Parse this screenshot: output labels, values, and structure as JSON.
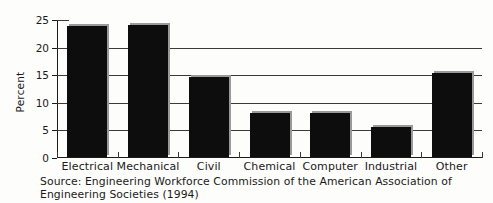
{
  "chart_data": {
    "type": "bar",
    "title": "",
    "xlabel": "",
    "ylabel": "Percent",
    "ylim": [
      0,
      25
    ],
    "ytick_values": [
      0,
      5,
      10,
      15,
      20,
      25
    ],
    "ytick_labels": [
      "0",
      "5",
      "10",
      "15",
      "20",
      "25"
    ],
    "grid": "horizontal",
    "legend": "none",
    "categories": [
      "Electrical",
      "Mechanical",
      "Civil",
      "Chemical",
      "Computer",
      "Industrial",
      "Other"
    ],
    "values": [
      23.8,
      23.9,
      14.5,
      8.0,
      8.0,
      5.4,
      15.2
    ],
    "bar_color": "#0d0d0d",
    "bar_shadow_color": "#9a9a9a",
    "axis_color": "#1a1a1a",
    "gridline_color": "#3a3a3a",
    "background_color": "#fdfdfb"
  },
  "source": {
    "line1": "Source: Engineering Workforce Commission of the American Association of",
    "line2": "Engineering Societies (1994)"
  }
}
